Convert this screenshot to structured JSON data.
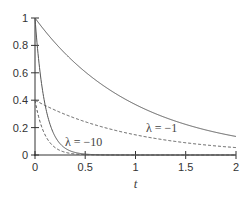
{
  "chart_data": {
    "type": "line",
    "title": "",
    "xlabel": "t",
    "ylabel": "",
    "xlim": [
      0,
      2
    ],
    "ylim": [
      0,
      1
    ],
    "grid": false,
    "legend": "none (inline annotations)",
    "x_ticks": [
      "0",
      "0.5",
      "1",
      "1.5",
      "2"
    ],
    "y_ticks": [
      "0",
      "0.2",
      "0.4",
      "0.6",
      "0.8",
      "1"
    ],
    "series": [
      {
        "name": "λ = −1 (solid)",
        "style": "solid",
        "formula": "exp(-t)",
        "x": [
          0,
          0.25,
          0.5,
          0.75,
          1.0,
          1.25,
          1.5,
          1.75,
          2.0
        ],
        "values": [
          1.0,
          0.779,
          0.607,
          0.472,
          0.368,
          0.287,
          0.223,
          0.174,
          0.135
        ]
      },
      {
        "name": "λ = −1 (dashed)",
        "style": "dashed",
        "formula": "0.4*exp(-t)",
        "x": [
          0,
          0.25,
          0.5,
          0.75,
          1.0,
          1.25,
          1.5,
          1.75,
          2.0
        ],
        "values": [
          0.4,
          0.312,
          0.243,
          0.189,
          0.147,
          0.115,
          0.089,
          0.069,
          0.054
        ]
      },
      {
        "name": "λ = −10 (solid)",
        "style": "solid",
        "formula": "exp(-10t)",
        "x": [
          0,
          0.05,
          0.1,
          0.15,
          0.2,
          0.3,
          0.4,
          0.5,
          2.0
        ],
        "values": [
          1.0,
          0.607,
          0.368,
          0.223,
          0.135,
          0.05,
          0.018,
          0.007,
          0.0
        ]
      },
      {
        "name": "λ = −10 (dashed)",
        "style": "dashed",
        "formula": "0.4*exp(-10t)",
        "x": [
          0,
          0.05,
          0.1,
          0.15,
          0.2,
          0.3,
          0.4,
          0.5,
          2.0
        ],
        "values": [
          0.4,
          0.243,
          0.147,
          0.089,
          0.054,
          0.02,
          0.007,
          0.003,
          0.0
        ]
      }
    ],
    "annotations": [
      {
        "text": "λ = −10",
        "x": 0.38,
        "y": 0.09
      },
      {
        "text": "λ = −1",
        "x": 1.2,
        "y": 0.2
      }
    ]
  },
  "labels": {
    "xlabel": "t",
    "annot_fast": "λ = −10",
    "annot_slow": "λ = −1",
    "xticks": [
      "0",
      "0.5",
      "1",
      "1.5",
      "2"
    ],
    "yticks": [
      "0",
      "0.2",
      "0.4",
      "0.6",
      "0.8",
      "1"
    ]
  },
  "colors": {
    "curve": "#555555",
    "axis": "#333333"
  }
}
